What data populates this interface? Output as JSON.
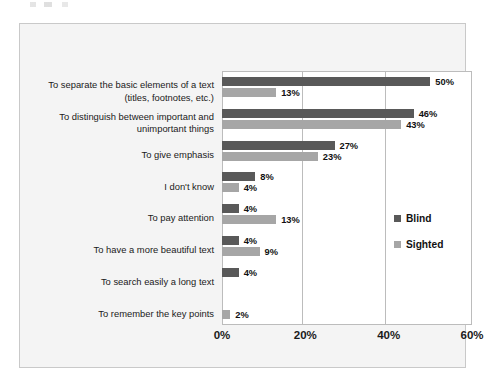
{
  "chart_data": {
    "type": "bar",
    "orientation": "horizontal",
    "title": "",
    "xlabel": "",
    "ylabel": "",
    "xlim": [
      0,
      60
    ],
    "xticks": [
      "0%",
      "20%",
      "40%",
      "60%"
    ],
    "xtick_values": [
      0,
      20,
      40,
      60
    ],
    "grid": true,
    "legend_position": "middle-right",
    "categories": [
      "To separate the basic elements of a text (titles, footnotes, etc.)",
      "To distinguish between important and unimportant things",
      "To give emphasis",
      "I don't know",
      "To pay attention",
      "To have a more beautiful text",
      "To search easily a long text",
      "To remember the key points"
    ],
    "category_lines": [
      [
        "To separate the basic elements of a text",
        "(titles, footnotes, etc.)"
      ],
      [
        "To distinguish between important and",
        "unimportant things"
      ],
      [
        "To give emphasis"
      ],
      [
        "I don't know"
      ],
      [
        "To pay attention"
      ],
      [
        "To have a more beautiful text"
      ],
      [
        "To search easily a long text"
      ],
      [
        "To remember the key points"
      ]
    ],
    "series": [
      {
        "name": "Blind",
        "color": "#595959",
        "values": [
          50,
          46,
          27,
          8,
          4,
          4,
          4,
          null
        ],
        "labels": [
          "50%",
          "46%",
          "27%",
          "8%",
          "4%",
          "4%",
          "4%",
          ""
        ]
      },
      {
        "name": "Sighted",
        "color": "#a6a6a6",
        "values": [
          13,
          43,
          23,
          4,
          13,
          9,
          null,
          2
        ],
        "labels": [
          "13%",
          "43%",
          "23%",
          "4%",
          "13%",
          "9%",
          "",
          "2%"
        ]
      }
    ]
  },
  "legend": {
    "items": [
      {
        "label": "Blind",
        "color": "#595959"
      },
      {
        "label": "Sighted",
        "color": "#a6a6a6"
      }
    ]
  },
  "colors": {
    "blind": "#595959",
    "sighted": "#a6a6a6",
    "frame_background": "#f4f4f4",
    "plot_background": "#ffffff",
    "gridline": "#bcbcbc",
    "text": "#1a1a1a"
  }
}
